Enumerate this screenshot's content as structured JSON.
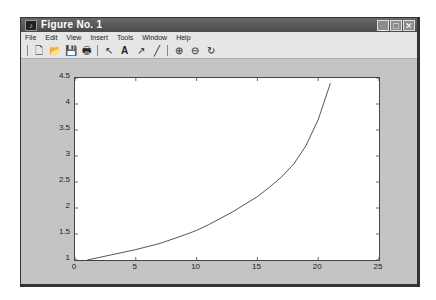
{
  "window": {
    "title": "Figure No. 1",
    "controls": [
      "minimize",
      "maximize",
      "close"
    ]
  },
  "menubar": {
    "items": [
      "File",
      "Edit",
      "View",
      "Insert",
      "Tools",
      "Window",
      "Help"
    ]
  },
  "toolbar": {
    "buttons": [
      {
        "name": "new-figure-icon",
        "glyph": "🗋"
      },
      {
        "name": "open-file-icon",
        "glyph": "📂"
      },
      {
        "name": "save-icon",
        "glyph": "💾"
      },
      {
        "name": "print-icon",
        "glyph": "🖶"
      },
      {
        "name": "select-arrow-icon",
        "glyph": "↖"
      },
      {
        "name": "insert-text-icon",
        "glyph": "A"
      },
      {
        "name": "insert-arrow-icon",
        "glyph": "↗"
      },
      {
        "name": "insert-line-icon",
        "glyph": "╱"
      },
      {
        "name": "zoom-in-icon",
        "glyph": "⊕"
      },
      {
        "name": "zoom-out-icon",
        "glyph": "⊖"
      },
      {
        "name": "rotate-3d-icon",
        "glyph": "↻"
      }
    ]
  },
  "chart_data": {
    "type": "line",
    "title": "",
    "xlabel": "",
    "ylabel": "",
    "xlim": [
      0,
      25
    ],
    "ylim": [
      1,
      4.5
    ],
    "xticks": [
      "0",
      "5",
      "10",
      "15",
      "20",
      "25"
    ],
    "yticks": [
      "1",
      "1.5",
      "2",
      "2.5",
      "3",
      "3.5",
      "4",
      "4.5"
    ],
    "grid": false,
    "series": [
      {
        "name": "y",
        "color": "#555555",
        "x": [
          1,
          3,
          5,
          7,
          9,
          10,
          11,
          13,
          15,
          16,
          17,
          18,
          19,
          20,
          21
        ],
        "y": [
          1.0,
          1.1,
          1.2,
          1.32,
          1.48,
          1.57,
          1.68,
          1.93,
          2.22,
          2.4,
          2.6,
          2.85,
          3.2,
          3.7,
          4.4
        ]
      }
    ]
  }
}
